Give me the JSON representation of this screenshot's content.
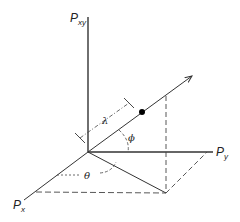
{
  "diagram": {
    "axes": {
      "vertical": {
        "label": "P",
        "subscript": "xy"
      },
      "horizontal": {
        "label": "P",
        "subscript": "y"
      },
      "diagonal": {
        "label": "P",
        "subscript": "x"
      }
    },
    "angles": {
      "theta": "θ",
      "phi": "ϕ"
    },
    "length": {
      "lambda": "λ"
    },
    "colors": {
      "line": "#333333",
      "dashed": "#444444",
      "point": "#000000"
    }
  }
}
